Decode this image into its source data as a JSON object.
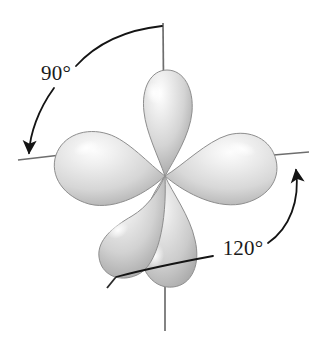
{
  "figure": {
    "name": "hybrid-orbital-lobe-diagram",
    "background_color": "#ffffff"
  },
  "colors": {
    "lobe_fill_light": "#f2f2f2",
    "lobe_fill_mid": "#cfcfcf",
    "lobe_fill_dark": "#9a9a9a",
    "lobe_edge": "#8e8e8e",
    "highlight": "#ffffff",
    "axis_line": "#6e6e6e",
    "annotation_line": "#141414",
    "text": "#1a1a1a"
  },
  "annotations": [
    {
      "id": "angle-90",
      "label": "90°",
      "value": 90,
      "unit": "degrees",
      "text_x": 56,
      "text_y": 80,
      "arrow_direction": "counterclockwise-down-left"
    },
    {
      "id": "angle-120",
      "label": "120°",
      "value": 120,
      "unit": "degrees",
      "text_x": 222,
      "text_y": 255,
      "arrow_direction": "clockwise-up-right"
    }
  ],
  "axes": [
    {
      "id": "axis-vertical-top",
      "label": "top vertical axis"
    },
    {
      "id": "axis-left",
      "label": "left horizontal axis"
    },
    {
      "id": "axis-right",
      "label": "right horizontal axis"
    },
    {
      "id": "axis-vertical-bottom",
      "label": "bottom vertical axis"
    },
    {
      "id": "axis-lower-left",
      "label": "lower-left diagonal axis"
    }
  ],
  "lobes": [
    {
      "id": "lobe-top",
      "label": "upper vertical lobe",
      "angle_deg": -90
    },
    {
      "id": "lobe-left",
      "label": "left equatorial lobe",
      "angle_deg": 188
    },
    {
      "id": "lobe-right",
      "label": "right equatorial lobe",
      "angle_deg": 6
    },
    {
      "id": "lobe-lower-left",
      "label": "lower-left lobe",
      "angle_deg": 125
    },
    {
      "id": "lobe-bottom",
      "label": "lower vertical lobe",
      "angle_deg": 82
    }
  ]
}
